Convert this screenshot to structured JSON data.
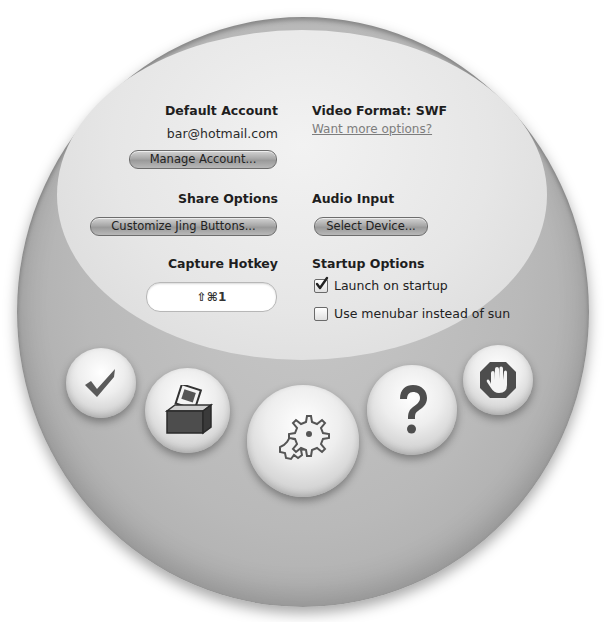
{
  "account": {
    "heading": "Default Account",
    "email": "bar@hotmail.com",
    "manage_button": "Manage Account..."
  },
  "video": {
    "heading": "Video Format:  SWF",
    "more_options_link": "Want more options?"
  },
  "share": {
    "heading": "Share Options",
    "customize_button": "Customize Jing Buttons..."
  },
  "audio": {
    "heading": "Audio Input",
    "select_button": "Select Device..."
  },
  "hotkey": {
    "heading": "Capture Hotkey",
    "value": "⇧⌘1"
  },
  "startup": {
    "heading": "Startup Options",
    "options": [
      {
        "label": "Launch on startup",
        "checked": true
      },
      {
        "label": "Use menubar instead of sun",
        "checked": false
      }
    ]
  },
  "orbs": [
    {
      "name": "checkmark-icon",
      "action": "done"
    },
    {
      "name": "ballot-box-icon",
      "action": "history"
    },
    {
      "name": "gears-icon",
      "action": "preferences"
    },
    {
      "name": "question-mark-icon",
      "action": "help"
    },
    {
      "name": "stop-hand-icon",
      "action": "quit"
    }
  ],
  "colors": {
    "sphere": "#b9b9b9",
    "inner_panel": "#e8e8e8",
    "icon_dark": "#5a5a5a"
  }
}
